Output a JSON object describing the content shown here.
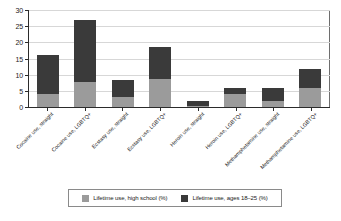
{
  "chart_data": {
    "type": "bar",
    "subtype": "stacked-vertical",
    "title": "",
    "xlabel": "",
    "ylabel": "",
    "ylim": [
      0,
      30
    ],
    "yticks": [
      0,
      5,
      10,
      15,
      20,
      25,
      30
    ],
    "ytick_labels": [
      "0",
      "5",
      "10",
      "15",
      "20",
      "25",
      "30"
    ],
    "grid": true,
    "grid_axis": "y",
    "legend_position": "bottom",
    "categories": [
      "Cocaine use, straight",
      "Cocaine use, LGBTQ+",
      "Ecstasy use, straight",
      "Ecstasy use, LGBTQ+",
      "Heroin use, straight",
      "Heroin use, LGBTQ+",
      "Methamphetamine use, straight",
      "Methamphetamine use, LGBTQ+"
    ],
    "series": [
      {
        "name": "Lifetime use, high school (%)",
        "color": "#9b9b9b",
        "values": [
          4.0,
          7.8,
          3.0,
          8.8,
          0.3,
          4.0,
          2.0,
          5.8
        ]
      },
      {
        "name": "Lifetime use, ages 18–25 (%)",
        "color": "#3a3a3a",
        "values": [
          12.0,
          19.2,
          5.3,
          9.9,
          1.6,
          2.0,
          3.9,
          5.9
        ]
      }
    ],
    "totals": [
      16.0,
      27.0,
      8.3,
      18.7,
      1.9,
      6.0,
      5.9,
      11.7
    ]
  },
  "legend": {
    "items": [
      {
        "label": "Lifetime use, high school (%)",
        "color": "#9b9b9b"
      },
      {
        "label": "Lifetime use, ages 18–25 (%)",
        "color": "#3a3a3a"
      }
    ]
  },
  "colors": {
    "high_school": "#9b9b9b",
    "ages_18_25": "#3a3a3a",
    "axis": "#2b2b2b",
    "grid": "#d7d7d7",
    "frame": "#6e6e6e",
    "background": "#ffffff"
  }
}
